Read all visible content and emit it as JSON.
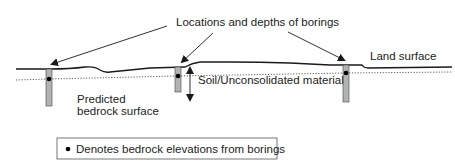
{
  "title": "Locations and depths of borings",
  "labels": {
    "borings_callout": "Locations and depths of borings",
    "land_surface": "Land surface",
    "soil": "Soil/Unconsolidated material",
    "bedrock_line1": "Predicted",
    "bedrock_line2": "bedrock surface"
  },
  "legend": {
    "marker": "•",
    "text": "Denotes bedrock elevations from borings"
  },
  "borings": [
    {
      "id": 1,
      "x": 49,
      "top": 69,
      "bottom": 106,
      "bedrock_y": 79
    },
    {
      "id": 2,
      "x": 178,
      "top": 67,
      "bottom": 92,
      "bedrock_y": 76
    },
    {
      "id": 3,
      "x": 346,
      "top": 65,
      "bottom": 102,
      "bedrock_y": 73
    }
  ],
  "colors": {
    "line": "#1a1a1a",
    "boring_fill": "#b3b3b3",
    "text": "#222222"
  }
}
